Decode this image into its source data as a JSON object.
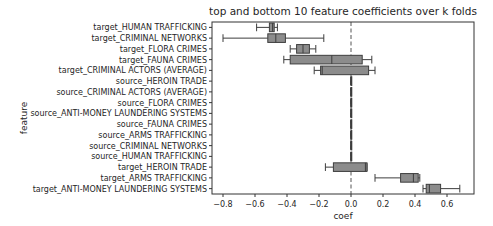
{
  "chart_data": {
    "type": "boxplot",
    "orientation": "horizontal",
    "title": "top and bottom 10 feature coefficients over k folds",
    "xlabel": "coef",
    "ylabel": "feature",
    "xlim": [
      -0.86,
      0.78
    ],
    "xticks": [
      -0.8,
      -0.6,
      -0.4,
      -0.2,
      0.0,
      0.2,
      0.4,
      0.6
    ],
    "xtick_labels": [
      "−0.8",
      "−0.6",
      "−0.4",
      "−0.2",
      "0.0",
      "0.2",
      "0.4",
      "0.6"
    ],
    "reference_line": {
      "x": 0.0,
      "style": "dashed"
    },
    "grid": false,
    "legend": null,
    "box_color": "#8c8c8c",
    "edge_color": "#3d3d3d",
    "categories": [
      "target_HUMAN TRAFFICKING",
      "target_CRIMINAL NETWORKS",
      "target_FLORA CRIMES",
      "target_FAUNA CRIMES",
      "target_CRIMINAL ACTORS (AVERAGE)",
      "source_HEROIN TRADE",
      "source_CRIMINAL ACTORS (AVERAGE)",
      "source_FLORA CRIMES",
      "source_ANTI-MONEY LAUNDERING SYSTEMS",
      "source_FAUNA CRIMES",
      "source_ARMS TRAFFICKING",
      "source_CRIMINAL NETWORKS",
      "source_HUMAN TRAFFICKING",
      "target_HEROIN TRADE",
      "target_ARMS TRAFFICKING",
      "target_ANTI-MONEY LAUNDERING SYSTEMS"
    ],
    "boxes": [
      {
        "whislo": -0.59,
        "q1": -0.51,
        "med": -0.49,
        "q3": -0.48,
        "whishi": -0.46
      },
      {
        "whislo": -0.8,
        "q1": -0.52,
        "med": -0.47,
        "q3": -0.41,
        "whishi": -0.17
      },
      {
        "whislo": -0.38,
        "q1": -0.34,
        "med": -0.3,
        "q3": -0.26,
        "whishi": -0.22
      },
      {
        "whislo": -0.42,
        "q1": -0.38,
        "med": -0.12,
        "q3": 0.07,
        "whishi": 0.13
      },
      {
        "whislo": -0.23,
        "q1": -0.19,
        "med": -0.18,
        "q3": 0.11,
        "whishi": 0.15
      },
      {
        "whislo": 0.0,
        "q1": 0.0,
        "med": 0.0,
        "q3": 0.0,
        "whishi": 0.0
      },
      {
        "whislo": 0.0,
        "q1": 0.0,
        "med": 0.0,
        "q3": 0.0,
        "whishi": 0.0
      },
      {
        "whislo": 0.0,
        "q1": 0.0,
        "med": 0.0,
        "q3": 0.0,
        "whishi": 0.0
      },
      {
        "whislo": 0.0,
        "q1": 0.0,
        "med": 0.0,
        "q3": 0.0,
        "whishi": 0.0
      },
      {
        "whislo": 0.0,
        "q1": 0.0,
        "med": 0.0,
        "q3": 0.0,
        "whishi": 0.0
      },
      {
        "whislo": 0.0,
        "q1": 0.0,
        "med": 0.0,
        "q3": 0.0,
        "whishi": 0.0
      },
      {
        "whislo": 0.0,
        "q1": 0.0,
        "med": 0.0,
        "q3": 0.0,
        "whishi": 0.0
      },
      {
        "whislo": 0.0,
        "q1": 0.0,
        "med": 0.0,
        "q3": 0.0,
        "whishi": 0.0
      },
      {
        "whislo": -0.16,
        "q1": -0.11,
        "med": 0.09,
        "q3": 0.1,
        "whishi": 0.1
      },
      {
        "whislo": 0.15,
        "q1": 0.31,
        "med": 0.39,
        "q3": 0.42,
        "whishi": 0.43
      },
      {
        "whislo": 0.45,
        "q1": 0.47,
        "med": 0.49,
        "q3": 0.56,
        "whishi": 0.68
      }
    ]
  }
}
